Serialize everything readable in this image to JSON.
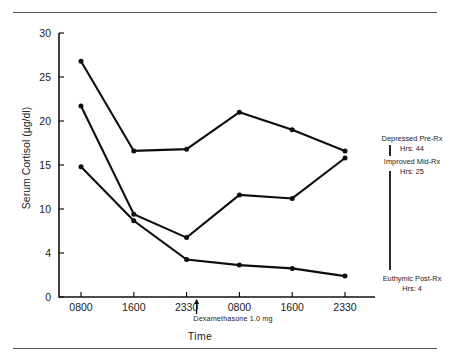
{
  "chart_data": {
    "type": "line",
    "title": "",
    "xlabel": "Time",
    "ylabel": "Serum Cortisol (µg/dl)",
    "categories": [
      "0800",
      "1600",
      "2330",
      "0800",
      "1600",
      "2330"
    ],
    "ytick_labels": [
      "30",
      "25",
      "20",
      "15",
      "10",
      "4",
      "0"
    ],
    "ytick_values": [
      30,
      25,
      20,
      15,
      10,
      4,
      0
    ],
    "ylim": [
      0,
      30
    ],
    "grid": false,
    "legend_position": "right",
    "series": [
      {
        "name": "Depressed Pre-Rx",
        "hrs_label": "Hrs: 44",
        "values": [
          26.8,
          16.6,
          16.8,
          21.0,
          19.0,
          16.6
        ]
      },
      {
        "name": "Improved Mid-Rx",
        "hrs_label": "Hrs: 25",
        "values": [
          21.7,
          9.3,
          6.1,
          11.6,
          11.2,
          15.8
        ]
      },
      {
        "name": "Euthymic Post-Rx",
        "hrs_label": "Hrs: 4",
        "values": [
          14.8,
          8.4,
          3.4,
          2.9,
          2.6,
          1.9
        ]
      }
    ],
    "annotations": [
      {
        "text": "Dexamethasone 1.0 mg",
        "at_category": "2330",
        "marker": "up-arrow"
      }
    ]
  },
  "figure": {
    "top_rule": "",
    "bottom_rule": ""
  }
}
